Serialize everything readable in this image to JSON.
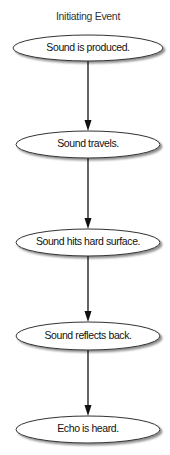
{
  "diagram": {
    "title": "Initiating Event",
    "nodes": [
      {
        "label": "Sound is produced."
      },
      {
        "label": "Sound travels."
      },
      {
        "label": "Sound hits hard surface."
      },
      {
        "label": "Sound reflects back."
      },
      {
        "label": "Echo is heard."
      }
    ],
    "edges": [
      {
        "from": 0,
        "to": 1
      },
      {
        "from": 1,
        "to": 2
      },
      {
        "from": 2,
        "to": 3
      },
      {
        "from": 3,
        "to": 4
      }
    ],
    "colors": {
      "node_fill": "#ffffff",
      "node_stroke": "#333333",
      "node_shadow": "#b0b0b0",
      "edge": "#111111",
      "text": "#111111"
    }
  }
}
